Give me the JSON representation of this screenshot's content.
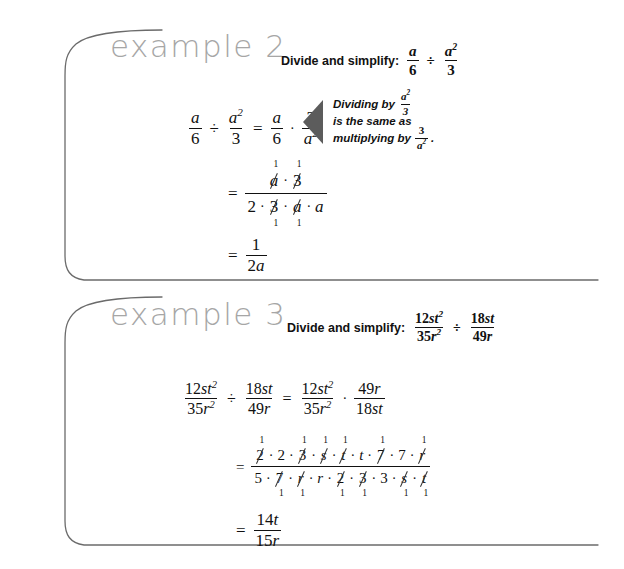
{
  "page": {
    "background": "#ffffff",
    "width": 624,
    "height": 569,
    "heading_color": "#a6a6a6",
    "rule_color": "#6b6b6b",
    "callout_color": "#5c5c5c",
    "text_color": "#111111"
  },
  "examples": [
    {
      "id": "example-2",
      "heading": "example 2",
      "prompt_label": "Divide and simplify:",
      "prompt_expression": {
        "left": {
          "num": "a",
          "den": "6"
        },
        "operator": "÷",
        "right": {
          "num": "a²",
          "den": "3"
        }
      },
      "callout": {
        "line1_prefix": "Dividing by",
        "line1_frac": {
          "num": "a²",
          "den": "3"
        },
        "line2": "is the same as",
        "line3_prefix": "multiplying by",
        "line3_frac": {
          "num": "3",
          "den": "a²"
        },
        "line3_suffix": "."
      },
      "steps": [
        {
          "kind": "equation",
          "label": "step-1-rewrite",
          "tokens": [
            {
              "type": "frac",
              "num": "a",
              "den": "6"
            },
            {
              "type": "op",
              "text": "÷"
            },
            {
              "type": "frac",
              "num": "a²",
              "den": "3"
            },
            {
              "type": "op",
              "text": "="
            },
            {
              "type": "frac",
              "num": "a",
              "den": "6"
            },
            {
              "type": "op",
              "text": "·"
            },
            {
              "type": "frac",
              "num": "3",
              "den": "a²"
            }
          ]
        },
        {
          "kind": "cancel-fraction",
          "label": "step-2-factor-and-cancel",
          "equals": "=",
          "numerator": [
            {
              "text": "a",
              "italic": true,
              "cancelled": true,
              "mark": "1",
              "mark_pos": "above"
            },
            {
              "text": "·",
              "dot": true
            },
            {
              "text": "3",
              "italic": false,
              "cancelled": true,
              "mark": "1",
              "mark_pos": "above"
            }
          ],
          "denominator": [
            {
              "text": "2",
              "italic": false,
              "cancelled": false
            },
            {
              "text": "·",
              "dot": true
            },
            {
              "text": "3",
              "italic": false,
              "cancelled": true,
              "mark": "1",
              "mark_pos": "below"
            },
            {
              "text": "·",
              "dot": true
            },
            {
              "text": "a",
              "italic": true,
              "cancelled": true,
              "mark": "1",
              "mark_pos": "below"
            },
            {
              "text": "·",
              "dot": true
            },
            {
              "text": "a",
              "italic": true,
              "cancelled": false
            }
          ]
        },
        {
          "kind": "equation",
          "label": "step-3-answer",
          "tokens": [
            {
              "type": "op",
              "text": "="
            },
            {
              "type": "frac",
              "num": "1",
              "den": "2a",
              "den_italic_tail": true
            }
          ]
        }
      ]
    },
    {
      "id": "example-3",
      "heading": "example 3",
      "prompt_label": "Divide and simplify:",
      "prompt_expression": {
        "left": {
          "num": "12st²",
          "den": "35r²"
        },
        "operator": "÷",
        "right": {
          "num": "18st",
          "den": "49r"
        }
      },
      "steps": [
        {
          "kind": "equation",
          "label": "step-1-rewrite",
          "tokens": [
            {
              "type": "frac",
              "num": "12st²",
              "den": "35r²"
            },
            {
              "type": "op",
              "text": "÷"
            },
            {
              "type": "frac",
              "num": "18st",
              "den": "49r"
            },
            {
              "type": "op",
              "text": "="
            },
            {
              "type": "frac",
              "num": "12st²",
              "den": "35r²"
            },
            {
              "type": "op",
              "text": "·"
            },
            {
              "type": "frac",
              "num": "49r",
              "den": "18st"
            }
          ]
        },
        {
          "kind": "cancel-fraction",
          "label": "step-2-factor-and-cancel",
          "equals": "=",
          "numerator": [
            {
              "text": "2",
              "italic": false,
              "cancelled": true,
              "mark": "1",
              "mark_pos": "above"
            },
            {
              "text": "·",
              "dot": true
            },
            {
              "text": "2",
              "italic": false,
              "cancelled": false
            },
            {
              "text": "·",
              "dot": true
            },
            {
              "text": "3",
              "italic": false,
              "cancelled": true,
              "mark": "1",
              "mark_pos": "above"
            },
            {
              "text": "·",
              "dot": true
            },
            {
              "text": "s",
              "italic": true,
              "cancelled": true,
              "mark": "1",
              "mark_pos": "above"
            },
            {
              "text": "·",
              "dot": true
            },
            {
              "text": "t",
              "italic": true,
              "cancelled": true,
              "mark": "1",
              "mark_pos": "above"
            },
            {
              "text": "·",
              "dot": true
            },
            {
              "text": "t",
              "italic": true,
              "cancelled": false
            },
            {
              "text": "·",
              "dot": true
            },
            {
              "text": "7",
              "italic": false,
              "cancelled": true,
              "mark": "1",
              "mark_pos": "above"
            },
            {
              "text": "·",
              "dot": true
            },
            {
              "text": "7",
              "italic": false,
              "cancelled": false
            },
            {
              "text": "·",
              "dot": true
            },
            {
              "text": "r",
              "italic": true,
              "cancelled": true,
              "mark": "1",
              "mark_pos": "above"
            }
          ],
          "denominator": [
            {
              "text": "5",
              "italic": false,
              "cancelled": false
            },
            {
              "text": "·",
              "dot": true
            },
            {
              "text": "7",
              "italic": false,
              "cancelled": true,
              "mark": "1",
              "mark_pos": "below"
            },
            {
              "text": "·",
              "dot": true
            },
            {
              "text": "r",
              "italic": true,
              "cancelled": true,
              "mark": "1",
              "mark_pos": "below"
            },
            {
              "text": "·",
              "dot": true
            },
            {
              "text": "r",
              "italic": true,
              "cancelled": false
            },
            {
              "text": "·",
              "dot": true
            },
            {
              "text": "2",
              "italic": false,
              "cancelled": true,
              "mark": "1",
              "mark_pos": "below"
            },
            {
              "text": "·",
              "dot": true
            },
            {
              "text": "3",
              "italic": false,
              "cancelled": true,
              "mark": "1",
              "mark_pos": "below"
            },
            {
              "text": "·",
              "dot": true
            },
            {
              "text": "3",
              "italic": false,
              "cancelled": false
            },
            {
              "text": "·",
              "dot": true
            },
            {
              "text": "s",
              "italic": true,
              "cancelled": true,
              "mark": "1",
              "mark_pos": "below"
            },
            {
              "text": "·",
              "dot": true
            },
            {
              "text": "t",
              "italic": true,
              "cancelled": true,
              "mark": "1",
              "mark_pos": "below"
            }
          ]
        },
        {
          "kind": "equation",
          "label": "step-3-answer",
          "tokens": [
            {
              "type": "op",
              "text": "="
            },
            {
              "type": "frac",
              "num": "14t",
              "den": "15r",
              "num_italic_tail": true,
              "den_italic_tail": true
            }
          ]
        }
      ]
    }
  ]
}
